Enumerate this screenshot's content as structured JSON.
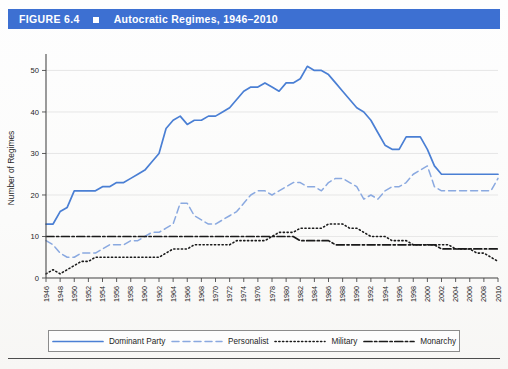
{
  "header": {
    "figure_number": "FIGURE 6.4",
    "bullet_icon": "square-bullet-icon",
    "title": "Autocratic Regimes, 1946–2010",
    "bar_color": "#3d70d2"
  },
  "legend": {
    "items": [
      {
        "label": "Dominant Party",
        "style": "solid",
        "color": "#4a7fd4",
        "swatch_icon": "solid-line-icon"
      },
      {
        "label": "Personalist",
        "style": "dashed",
        "color": "#8aa9e0",
        "swatch_icon": "dashed-line-icon"
      },
      {
        "label": "Military",
        "style": "dotted",
        "color": "#1a1a1a",
        "swatch_icon": "dotted-line-icon"
      },
      {
        "label": "Monarchy",
        "style": "dashdot",
        "color": "#1a1a1a",
        "swatch_icon": "dashdot-line-icon"
      }
    ]
  },
  "chart_data": {
    "type": "line",
    "title": "Autocratic Regimes, 1946–2010",
    "xlabel": "",
    "ylabel": "Number of Regimes",
    "xlim": [
      1946,
      2010
    ],
    "ylim": [
      0,
      53
    ],
    "yticks": [
      0,
      10,
      20,
      30,
      40,
      50
    ],
    "grid": "horizontal",
    "legend_position": "bottom",
    "x": [
      1946,
      1947,
      1948,
      1949,
      1950,
      1951,
      1952,
      1953,
      1954,
      1955,
      1956,
      1957,
      1958,
      1959,
      1960,
      1961,
      1962,
      1963,
      1964,
      1965,
      1966,
      1967,
      1968,
      1969,
      1970,
      1971,
      1972,
      1973,
      1974,
      1975,
      1976,
      1977,
      1978,
      1979,
      1980,
      1981,
      1982,
      1983,
      1984,
      1985,
      1986,
      1987,
      1988,
      1989,
      1990,
      1991,
      1992,
      1993,
      1994,
      1995,
      1996,
      1997,
      1998,
      1999,
      2000,
      2001,
      2002,
      2003,
      2004,
      2005,
      2006,
      2007,
      2008,
      2009,
      2010
    ],
    "xticks": [
      1946,
      1948,
      1950,
      1952,
      1954,
      1956,
      1958,
      1960,
      1962,
      1964,
      1966,
      1968,
      1970,
      1972,
      1974,
      1976,
      1978,
      1980,
      1982,
      1984,
      1986,
      1988,
      1990,
      1992,
      1994,
      1996,
      1998,
      2000,
      2002,
      2004,
      2006,
      2008,
      2010
    ],
    "series": [
      {
        "name": "Dominant Party",
        "color": "#4a7fd4",
        "style": "solid",
        "values": [
          13,
          13,
          16,
          17,
          21,
          21,
          21,
          21,
          22,
          22,
          23,
          23,
          24,
          25,
          26,
          28,
          30,
          36,
          38,
          39,
          37,
          38,
          38,
          39,
          39,
          40,
          41,
          43,
          45,
          46,
          46,
          47,
          46,
          45,
          47,
          47,
          48,
          51,
          50,
          50,
          49,
          47,
          45,
          43,
          41,
          40,
          38,
          35,
          32,
          31,
          31,
          34,
          34,
          34,
          31,
          27,
          25,
          25,
          25,
          25,
          25,
          25,
          25,
          25,
          25
        ]
      },
      {
        "name": "Personalist",
        "color": "#8aa9e0",
        "style": "dashed",
        "values": [
          9,
          8,
          6,
          5,
          5,
          6,
          6,
          6,
          7,
          8,
          8,
          8,
          9,
          9,
          10,
          11,
          11,
          12,
          13,
          18,
          18,
          15,
          14,
          13,
          13,
          14,
          15,
          16,
          18,
          20,
          21,
          21,
          20,
          21,
          22,
          23,
          23,
          22,
          22,
          21,
          23,
          24,
          24,
          23,
          22,
          19,
          20,
          19,
          21,
          22,
          22,
          23,
          25,
          26,
          27,
          22,
          21,
          21,
          21,
          21,
          21,
          21,
          21,
          21,
          24
        ]
      },
      {
        "name": "Military",
        "color": "#1a1a1a",
        "style": "dotted",
        "values": [
          1,
          2,
          1,
          2,
          3,
          4,
          4,
          5,
          5,
          5,
          5,
          5,
          5,
          5,
          5,
          5,
          5,
          6,
          7,
          7,
          7,
          8,
          8,
          8,
          8,
          8,
          8,
          9,
          9,
          9,
          9,
          9,
          10,
          11,
          11,
          11,
          12,
          12,
          12,
          12,
          13,
          13,
          13,
          12,
          12,
          11,
          10,
          10,
          10,
          9,
          9,
          9,
          8,
          8,
          8,
          8,
          8,
          8,
          7,
          7,
          7,
          6,
          6,
          5,
          4
        ]
      },
      {
        "name": "Monarchy",
        "color": "#1a1a1a",
        "style": "dashdot",
        "values": [
          10,
          10,
          10,
          10,
          10,
          10,
          10,
          10,
          10,
          10,
          10,
          10,
          10,
          10,
          10,
          10,
          10,
          10,
          10,
          10,
          10,
          10,
          10,
          10,
          10,
          10,
          10,
          10,
          10,
          10,
          10,
          10,
          10,
          10,
          10,
          10,
          9,
          9,
          9,
          9,
          9,
          8,
          8,
          8,
          8,
          8,
          8,
          8,
          8,
          8,
          8,
          8,
          8,
          8,
          8,
          8,
          7,
          7,
          7,
          7,
          7,
          7,
          7,
          7,
          7
        ]
      }
    ],
    "series_notes": {
      "Military_peak": {
        "year": 1977,
        "value": 18
      },
      "Dominant_Party_peak": {
        "year": 1980,
        "value": 51
      }
    }
  }
}
